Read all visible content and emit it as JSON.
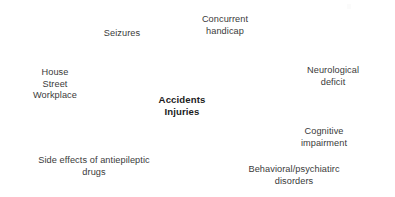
{
  "diagram": {
    "type": "concept-map",
    "title_node": "Accidents\nInjuries",
    "background_color": "#ffffff",
    "text_color": "#3a3a3a",
    "center_text_color": "#1c1c1c",
    "nodes": [
      {
        "id": "seizures",
        "label": "Seizures",
        "role": "factor",
        "position": "top-left"
      },
      {
        "id": "concurrent-handicap",
        "label": "Concurrent\nhandicap",
        "role": "factor",
        "position": "top-center"
      },
      {
        "id": "house-street-workplace",
        "label": "House\nStreet\nWorkplace",
        "role": "factor",
        "position": "left"
      },
      {
        "id": "neurological-deficit",
        "label": "Neurological deficit",
        "role": "factor",
        "position": "right-upper"
      },
      {
        "id": "accidents-injuries",
        "label": "Accidents\nInjuries",
        "role": "center",
        "position": "center"
      },
      {
        "id": "cognitive-impairment",
        "label": "Cognitive impairment",
        "role": "factor",
        "position": "right-lower"
      },
      {
        "id": "side-effects-antiepileptic-drugs",
        "label": "Side effects of antiepileptic\ndrugs",
        "role": "factor",
        "position": "bottom-left"
      },
      {
        "id": "behavioral-psychiatric-disorders",
        "label": "Behavioral/psychiatirc\ndisorders",
        "role": "factor",
        "position": "bottom-right"
      }
    ]
  }
}
